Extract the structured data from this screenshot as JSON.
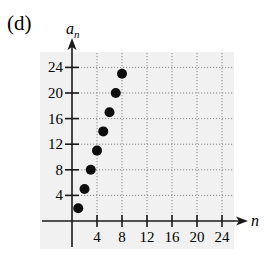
{
  "panel_label": "(d)",
  "chart_data": {
    "type": "scatter",
    "title": "",
    "xlabel": "n",
    "ylabel": "a_n",
    "ylabel_main": "a",
    "ylabel_sub": "n",
    "x_ticks": [
      4,
      8,
      12,
      16,
      20,
      24
    ],
    "y_ticks": [
      4,
      8,
      12,
      16,
      20,
      24
    ],
    "xlim": [
      0,
      25.5
    ],
    "ylim": [
      0,
      26
    ],
    "grid": true,
    "grid_style": "dotted",
    "legend": null,
    "series": [
      {
        "name": "a_n",
        "x": [
          1,
          2,
          3,
          4,
          5,
          6,
          7,
          8
        ],
        "y": [
          2,
          5,
          8,
          11,
          14,
          17,
          20,
          23
        ]
      }
    ]
  },
  "colors": {
    "plot_background": "#f1f1f1",
    "axis": "#1a1a1a",
    "grid": "#8a8a8a",
    "points": "#0d0d0d"
  }
}
